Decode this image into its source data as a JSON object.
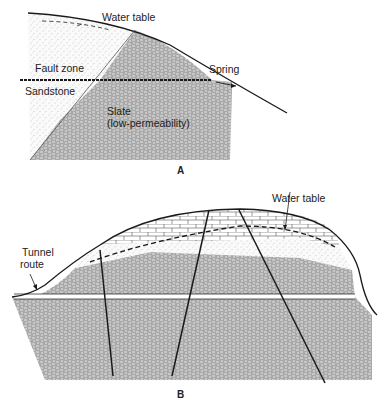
{
  "figure": {
    "panel_a": {
      "letter": "A",
      "labels": {
        "water_table": "Water table",
        "fault_zone": "Fault zone",
        "sandstone": "Sandstone",
        "slate_1": "Slate",
        "slate_2": "(low-permeability)",
        "spring": "Spring"
      }
    },
    "panel_b": {
      "letter": "B",
      "labels": {
        "water_table": "Water table",
        "tunnel_1": "Tunnel",
        "tunnel_2": "route"
      }
    }
  },
  "colors": {
    "line": "#1a1a1a",
    "rock_fill": "#b8b8b8",
    "sand_fill": "#f3f3f3"
  }
}
